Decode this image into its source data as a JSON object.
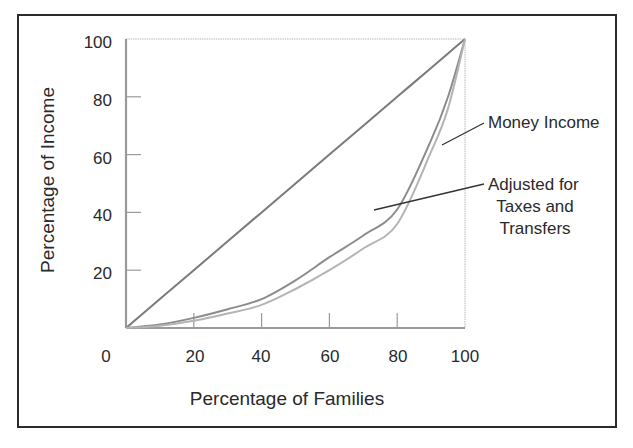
{
  "chart_data": {
    "type": "line",
    "title": "",
    "xlabel": "Percentage of Families",
    "ylabel": "Percentage of Income",
    "xlim": [
      0,
      100
    ],
    "ylim": [
      0,
      100
    ],
    "x_ticks": [
      0,
      20,
      40,
      60,
      80,
      100
    ],
    "y_ticks": [
      20,
      40,
      60,
      80,
      100
    ],
    "grid": false,
    "legend": "none (inline annotations with leader lines)",
    "x": [
      0,
      10,
      20,
      30,
      40,
      50,
      60,
      70,
      80,
      90,
      95,
      100
    ],
    "series": [
      {
        "name": "Line of Equality",
        "color": "#7a7a7a",
        "values": [
          0,
          10,
          20,
          30,
          40,
          50,
          60,
          70,
          80,
          90,
          95,
          100
        ]
      },
      {
        "name": "Adjusted for Taxes and Transfers",
        "color": "#8c8c8c",
        "values": [
          0,
          1.2,
          3.5,
          6.5,
          10,
          16.5,
          24.5,
          32,
          41,
          65,
          80,
          100
        ]
      },
      {
        "name": "Money Income",
        "color": "#b4b4b4",
        "values": [
          0,
          0.8,
          2.5,
          5,
          8,
          13.5,
          20,
          27.5,
          36,
          61,
          76,
          100
        ]
      }
    ],
    "annotations": [
      {
        "text": "Money Income",
        "points_to": "Money Income"
      },
      {
        "text": "Adjusted for Taxes and Transfers",
        "points_to": "Adjusted for Taxes and Transfers",
        "lines": [
          "Adjusted for",
          "Taxes and",
          "Transfers"
        ]
      }
    ]
  },
  "labels": {
    "xlabel": "Percentage of Families",
    "ylabel": "Percentage of Income",
    "x_ticks": [
      "0",
      "20",
      "40",
      "60",
      "80",
      "100"
    ],
    "y_ticks": [
      "20",
      "40",
      "60",
      "80",
      "100"
    ],
    "money_income": "Money Income",
    "adjusted_1": "Adjusted for",
    "adjusted_2": "Taxes and",
    "adjusted_3": "Transfers"
  },
  "colors": {
    "frame": "#2b2b2b",
    "axis": "#9a9a9a",
    "equality": "#7a7a7a",
    "adjusted": "#8c8c8c",
    "money": "#b4b4b4",
    "leader": "#333333"
  }
}
